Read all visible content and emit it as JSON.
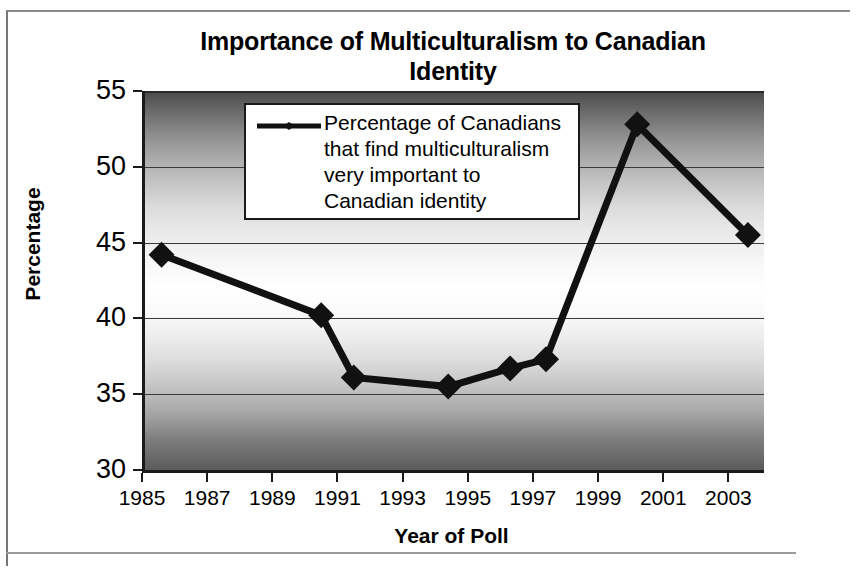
{
  "chart_data": {
    "type": "line",
    "title": "Importance of Multiculturalism to Canadian Identity",
    "xlabel": "Year of Poll",
    "ylabel": "Percentage",
    "xlim": [
      1985,
      2004
    ],
    "ylim": [
      30,
      55
    ],
    "xticks": [
      "1985",
      "1987",
      "1989",
      "1991",
      "1993",
      "1995",
      "1997",
      "1999",
      "2001",
      "2003"
    ],
    "yticks": [
      "30",
      "35",
      "40",
      "45",
      "50",
      "55"
    ],
    "grid": true,
    "legend_position": "top-center-inside",
    "series": [
      {
        "name": "Percentage of Canadians that find multiculturalism very important to Canadian identity",
        "marker": "diamond",
        "color": "#111111",
        "x": [
          1985.6,
          1990.5,
          1991.5,
          1994.4,
          1996.3,
          1997.4,
          2000.2,
          2003.6
        ],
        "values": [
          44.2,
          40.2,
          36.1,
          35.5,
          36.7,
          37.3,
          52.8,
          45.5
        ]
      }
    ]
  },
  "chart": {
    "title_line1": "Importance of Multiculturalism to Canadian",
    "title_line2": "Identity",
    "x_axis_title": "Year of Poll",
    "y_axis_title": "Percentage"
  },
  "legend": {
    "series_label_line1": "Percentage of Canadians",
    "series_label_line2": "that find multiculturalism",
    "series_label_line3": "very important to",
    "series_label_line4": "Canadian identity"
  },
  "colors": {
    "series": "#111111",
    "axis": "#1a1a1a",
    "gridline": "#3a3a3a",
    "legend_background": "#ffffff",
    "page_background": "#ffffff"
  }
}
